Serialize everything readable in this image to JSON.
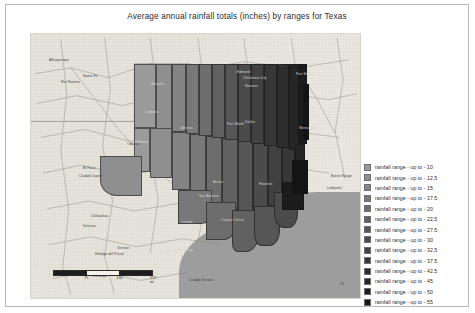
{
  "title": "Average annual rainfall totals (inches) by ranges for Texas",
  "map": {
    "name": "texas-rainfall-choropleth",
    "water_body_label": "Gulf of Mexico",
    "water_color": "#9d9d9d",
    "land_color": "#ece9e2",
    "scale_bar": {
      "units": "mi",
      "labels": [
        "75",
        "150",
        "225 mi"
      ],
      "unit_suffix": "mi"
    },
    "compass_label": "N",
    "cities": [
      {
        "label": "Albuquerque",
        "x": 18,
        "y": 24
      },
      {
        "label": "Santa Fe",
        "x": 52,
        "y": 40
      },
      {
        "label": "Rio Rancho",
        "x": 30,
        "y": 46
      },
      {
        "label": "Amarillo",
        "x": 120,
        "y": 48
      },
      {
        "label": "Lubbock",
        "x": 114,
        "y": 76
      },
      {
        "label": "Oklahoma City",
        "x": 212,
        "y": 42
      },
      {
        "label": "Tulsa",
        "x": 247,
        "y": 30
      },
      {
        "label": "Norman",
        "x": 214,
        "y": 50
      },
      {
        "label": "Edmond",
        "x": 206,
        "y": 36
      },
      {
        "label": "Fort Smith",
        "x": 265,
        "y": 38
      },
      {
        "label": "Fort Worth",
        "x": 196,
        "y": 88
      },
      {
        "label": "Dallas",
        "x": 214,
        "y": 86
      },
      {
        "label": "Shreveport",
        "x": 268,
        "y": 92
      },
      {
        "label": "Abilene",
        "x": 150,
        "y": 92
      },
      {
        "label": "Midland",
        "x": 104,
        "y": 106
      },
      {
        "label": "Odessa",
        "x": 96,
        "y": 108
      },
      {
        "label": "Austin",
        "x": 182,
        "y": 146
      },
      {
        "label": "San Antonio",
        "x": 168,
        "y": 160
      },
      {
        "label": "Houston",
        "x": 228,
        "y": 148
      },
      {
        "label": "Baton Rouge",
        "x": 300,
        "y": 140
      },
      {
        "label": "Lafayette",
        "x": 296,
        "y": 152
      },
      {
        "label": "Corpus Christi",
        "x": 190,
        "y": 184
      },
      {
        "label": "Laredo",
        "x": 150,
        "y": 186
      },
      {
        "label": "El Paso",
        "x": 52,
        "y": 132
      },
      {
        "label": "Ciudad Juarez",
        "x": 48,
        "y": 140
      },
      {
        "label": "Chihuahua",
        "x": 60,
        "y": 180
      },
      {
        "label": "Delicias",
        "x": 52,
        "y": 190
      },
      {
        "label": "Hidalgo del Parral",
        "x": 64,
        "y": 218
      },
      {
        "label": "Monterrey",
        "x": 146,
        "y": 214
      },
      {
        "label": "Saltillo",
        "x": 128,
        "y": 216
      },
      {
        "label": "Torreon",
        "x": 86,
        "y": 212
      },
      {
        "label": "Durango",
        "x": 62,
        "y": 240
      },
      {
        "label": "Ciudad Victoria",
        "x": 158,
        "y": 244
      }
    ]
  },
  "legend": {
    "name": "rainfall-range-legend",
    "items": [
      {
        "label": "rainfall range - up to - 10",
        "value": 10,
        "color": "#9a9a9a"
      },
      {
        "label": "rainfall range - up to - 12.5",
        "value": 12.5,
        "color": "#8f8f8f"
      },
      {
        "label": "rainfall range - up to - 15",
        "value": 15,
        "color": "#848484"
      },
      {
        "label": "rainfall range - up to - 17.5",
        "value": 17.5,
        "color": "#787878"
      },
      {
        "label": "rainfall range - up to - 20",
        "value": 20,
        "color": "#6d6d6d"
      },
      {
        "label": "rainfall range - up to - 22.5",
        "value": 22.5,
        "color": "#616161"
      },
      {
        "label": "rainfall range - up to - 27.5",
        "value": 27.5,
        "color": "#565656"
      },
      {
        "label": "rainfall range - up to - 30",
        "value": 30,
        "color": "#4b4b4b"
      },
      {
        "label": "rainfall range - up to - 32.5",
        "value": 32.5,
        "color": "#414141"
      },
      {
        "label": "rainfall range - up to - 37.5",
        "value": 37.5,
        "color": "#373737"
      },
      {
        "label": "rainfall range - up to - 42.5",
        "value": 42.5,
        "color": "#2d2d2d"
      },
      {
        "label": "rainfall range - up to - 45",
        "value": 45,
        "color": "#252525"
      },
      {
        "label": "rainfall range - up to - 50",
        "value": 50,
        "color": "#1c1c1c"
      },
      {
        "label": "rainfall range - up to - 55",
        "value": 55,
        "color": "#141414"
      }
    ]
  },
  "chart_data": {
    "type": "map",
    "title": "Average annual rainfall totals (inches) by ranges for Texas",
    "region": "Texas",
    "measure": "Average annual rainfall total",
    "unit": "inches",
    "classification": "graduated ranges (choropleth)",
    "class_breaks": [
      10,
      12.5,
      15,
      17.5,
      20,
      22.5,
      27.5,
      30,
      32.5,
      37.5,
      42.5,
      45,
      50,
      55
    ],
    "class_labels": [
      "rainfall range - up to - 10",
      "rainfall range - up to - 12.5",
      "rainfall range - up to - 15",
      "rainfall range - up to - 17.5",
      "rainfall range - up to - 20",
      "rainfall range - up to - 22.5",
      "rainfall range - up to - 27.5",
      "rainfall range - up to - 30",
      "rainfall range - up to - 32.5",
      "rainfall range - up to - 37.5",
      "rainfall range - up to - 42.5",
      "rainfall range - up to - 45",
      "rainfall range - up to - 50",
      "rainfall range - up to - 55"
    ],
    "colors": [
      "#9a9a9a",
      "#8f8f8f",
      "#848484",
      "#787878",
      "#6d6d6d",
      "#616161",
      "#565656",
      "#4b4b4b",
      "#414141",
      "#373737",
      "#2d2d2d",
      "#252525",
      "#1c1c1c",
      "#141414"
    ],
    "legend_position": "right",
    "scale_bar_labels": [
      "75",
      "150",
      "225 mi"
    ],
    "spatial_trend": "rainfall increases from west (low, ~10 in) to east (high, ~55 in)"
  }
}
